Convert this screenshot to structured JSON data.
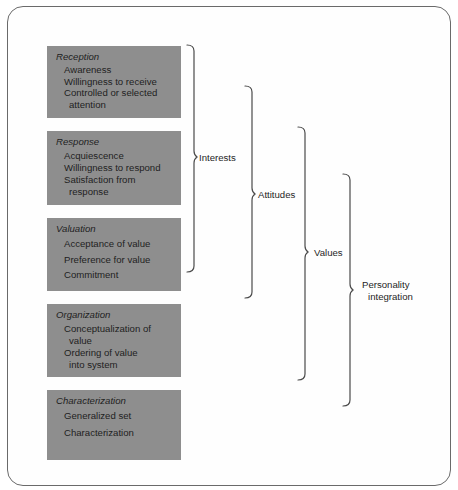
{
  "diagram": {
    "type": "taxonomy-hierarchy",
    "categories": [
      {
        "title": "Reception",
        "items": [
          {
            "line1": "Awareness"
          },
          {
            "line1": "Willingness to receive"
          },
          {
            "line1": "Controlled or selected",
            "line2": "attention"
          }
        ]
      },
      {
        "title": "Response",
        "items": [
          {
            "line1": "Acquiescence"
          },
          {
            "line1": "Willingness to respond"
          },
          {
            "line1": "Satisfaction from",
            "line2": "response"
          }
        ]
      },
      {
        "title": "Valuation",
        "items": [
          {
            "line1": "Acceptance of value"
          },
          {
            "line1": "Preference for value"
          },
          {
            "line1": "Commitment"
          }
        ]
      },
      {
        "title": "Organization",
        "items": [
          {
            "line1": "Conceptualization of",
            "line2": "value"
          },
          {
            "line1": "Ordering of value",
            "line2": "into system"
          }
        ]
      },
      {
        "title": "Characterization",
        "items": [
          {
            "line1": "Generalized set"
          },
          {
            "line1": "Characterization"
          }
        ]
      }
    ],
    "brackets": [
      {
        "label": "Interests"
      },
      {
        "label": "Attitudes"
      },
      {
        "label": "Values"
      },
      {
        "label_line1": "Personality",
        "label_line2": "integration"
      }
    ],
    "colors": {
      "box_fill": "#8e8e8e",
      "line": "#4a4a4a",
      "frame": "#6a6a6a"
    }
  }
}
